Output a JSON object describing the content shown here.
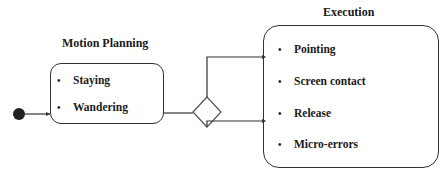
{
  "diagram": {
    "start_node": "initial-state",
    "motion_planning": {
      "title": "Motion Planning",
      "items": [
        "Staying",
        "Wandering"
      ]
    },
    "decision": "decision-diamond",
    "execution": {
      "title": "Execution",
      "items": [
        "Pointing",
        "Screen contact",
        "Release",
        "Micro-errors"
      ]
    },
    "bullet": "•",
    "colors": {
      "stroke": "#333333",
      "text": "#1a1a1a",
      "background": "#ffffff"
    }
  }
}
